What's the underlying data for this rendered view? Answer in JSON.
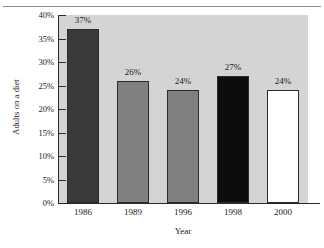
{
  "chart_data": {
    "type": "bar",
    "title": "",
    "xlabel": "Year",
    "ylabel": "Adults on a diet",
    "categories": [
      "1986",
      "1989",
      "1996",
      "1998",
      "2000"
    ],
    "values": [
      37,
      26,
      24,
      27,
      24
    ],
    "data_labels": [
      "37%",
      "26%",
      "24%",
      "27%",
      "24%"
    ],
    "bar_colors": [
      "#3a3a3a",
      "#808080",
      "#808080",
      "#0d0d0d",
      "#ffffff"
    ],
    "bar_edge_color": "#2b2b2b",
    "ylim": [
      0,
      40
    ],
    "ytick_values": [
      0,
      5,
      10,
      15,
      20,
      25,
      30,
      35,
      40
    ],
    "ytick_labels": [
      "0%",
      "5%",
      "10%",
      "15%",
      "20%",
      "25%",
      "30%",
      "35%",
      "40%"
    ],
    "grid": false,
    "legend": "none",
    "plot_background": "#d4d4d4",
    "figure_background": "#ffffff"
  }
}
